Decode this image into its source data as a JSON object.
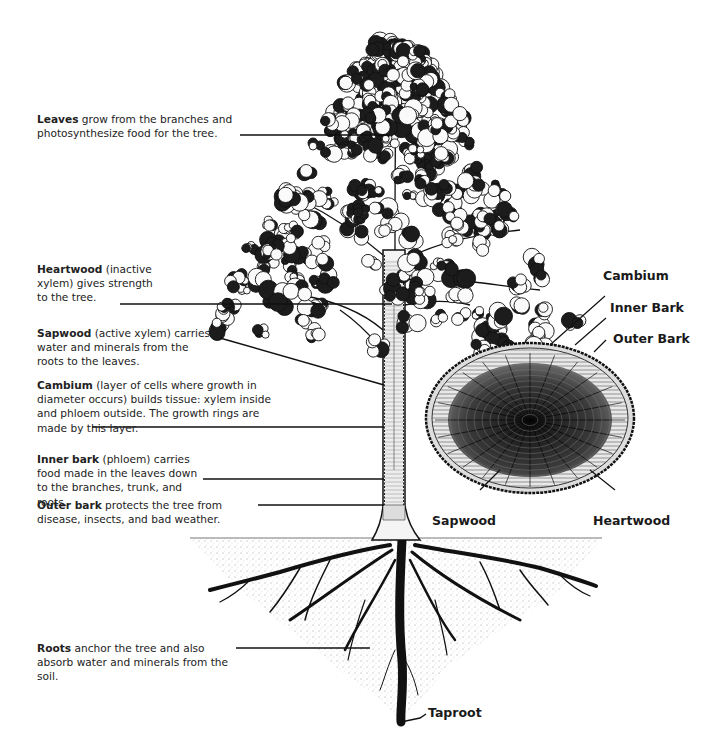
{
  "diagram": {
    "annotations": [
      {
        "id": "leaves",
        "term": "Leaves",
        "text": " grow from the branches and photosynthesize food for the tree."
      },
      {
        "id": "heartwood",
        "term": "Heartwood",
        "text": " (inactive xylem) gives strength to the tree."
      },
      {
        "id": "sapwood",
        "term": "Sapwood",
        "text": " (active xylem) carries water and minerals from the roots to the leaves."
      },
      {
        "id": "cambium",
        "term": "Cambium",
        "text": " (layer of cells where growth in diameter occurs) builds tissue: xylem inside and phloem outside. The growth rings are made by this layer."
      },
      {
        "id": "inner-bark",
        "term": "Inner bark",
        "text": " (phloem) carries food made in the leaves down to the branches, trunk, and roots."
      },
      {
        "id": "outer-bark",
        "term": "Outer bark",
        "text": " protects the tree from disease, insects, and bad weather."
      },
      {
        "id": "roots",
        "term": "Roots",
        "text": " anchor the tree and also absorb water and minerals from the soil."
      }
    ],
    "cross_section_labels": {
      "cambium": "Cambium",
      "inner_bark": "Inner Bark",
      "outer_bark": "Outer Bark",
      "sapwood": "Sapwood",
      "heartwood": "Heartwood"
    },
    "taproot_label": "Taproot"
  }
}
